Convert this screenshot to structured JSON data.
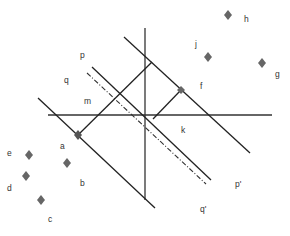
{
  "diagram": {
    "colors": {
      "line": "#222222",
      "axis": "#333333",
      "marker": "#666666",
      "text": "#333333"
    },
    "labels": {
      "p": "p",
      "q": "q",
      "m": "m",
      "j": "j",
      "h": "h",
      "g": "g",
      "f": "f",
      "k": "k",
      "a": "a",
      "b": "b",
      "c": "c",
      "d": "d",
      "e": "e",
      "p_prime": "p'",
      "q_prime": "q'"
    },
    "points": [
      {
        "name": "h",
        "x": 228,
        "y": 15
      },
      {
        "name": "j",
        "x": 208,
        "y": 57
      },
      {
        "name": "g",
        "x": 262,
        "y": 63
      },
      {
        "name": "f-marker",
        "x": 181,
        "y": 90
      },
      {
        "name": "a-marker",
        "x": 78,
        "y": 135
      },
      {
        "name": "e",
        "x": 29,
        "y": 155
      },
      {
        "name": "a-point",
        "x": 67,
        "y": 163
      },
      {
        "name": "d",
        "x": 26,
        "y": 176
      },
      {
        "name": "c",
        "x": 41,
        "y": 200
      }
    ]
  }
}
